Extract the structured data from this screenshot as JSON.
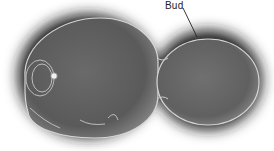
{
  "figure": {
    "annotations": [
      {
        "text": "Bud",
        "target": "daughter cell"
      }
    ]
  },
  "colors": {
    "background": "#ffffff",
    "halo": "#1a1a1a",
    "cell_mid": "#6e6e6e",
    "cell_dark": "#4a4a4a",
    "cell_edge": "#d8d8d8"
  }
}
